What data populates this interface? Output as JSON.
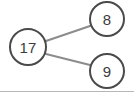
{
  "diagram": {
    "type": "number-bond",
    "colors": {
      "background": "#ffffff",
      "node_stroke": "#4a4a4a",
      "node_fill": "#ffffff",
      "label_text": "#3c3c3c",
      "edge_stroke": "#8c8c8c",
      "bottom_rule": "#b7b7b7"
    },
    "nodes": {
      "total": {
        "label": "17",
        "role": "whole",
        "cx": 28,
        "cy": 47,
        "r": 19
      },
      "part_1": {
        "label": "8",
        "role": "part",
        "cx": 107,
        "cy": 19,
        "r": 18
      },
      "part_2": {
        "label": "9",
        "role": "part",
        "cx": 107,
        "cy": 71,
        "r": 18
      }
    },
    "edges": [
      {
        "name": "edge-total-to-part-1",
        "from": "total",
        "to": "part_1",
        "x1": 46,
        "y1": 41,
        "x2": 90,
        "y2": 26
      },
      {
        "name": "edge-total-to-part-2",
        "from": "total",
        "to": "part_2",
        "x1": 46,
        "y1": 54,
        "x2": 90,
        "y2": 65
      }
    ]
  }
}
